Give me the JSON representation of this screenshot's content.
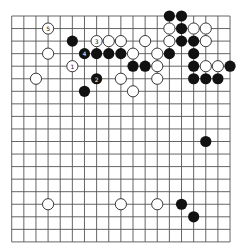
{
  "board": {
    "size": 19,
    "origin_x": 11.7,
    "origin_y": 16,
    "spacing_x": 12.13,
    "spacing_y": 12.55,
    "stone_radius": 5.6,
    "line_color": "#555555",
    "black_color": "#111111",
    "white_fill": "#ffffff",
    "white_stroke": "#222222"
  },
  "stones": {
    "black": [
      {
        "c": 13,
        "r": 0
      },
      {
        "c": 14,
        "r": 0
      },
      {
        "c": 14,
        "r": 1
      },
      {
        "c": 5,
        "r": 2
      },
      {
        "c": 14,
        "r": 2
      },
      {
        "c": 15,
        "r": 2
      },
      {
        "c": 6,
        "r": 3,
        "label": "4"
      },
      {
        "c": 7,
        "r": 3
      },
      {
        "c": 8,
        "r": 3
      },
      {
        "c": 9,
        "r": 3
      },
      {
        "c": 13,
        "r": 3
      },
      {
        "c": 15,
        "r": 3
      },
      {
        "c": 10,
        "r": 4
      },
      {
        "c": 11,
        "r": 4
      },
      {
        "c": 15,
        "r": 4
      },
      {
        "c": 18,
        "r": 4
      },
      {
        "c": 7,
        "r": 5,
        "label": "2"
      },
      {
        "c": 15,
        "r": 5
      },
      {
        "c": 16,
        "r": 5
      },
      {
        "c": 17,
        "r": 5
      },
      {
        "c": 6,
        "r": 6
      },
      {
        "c": 16,
        "r": 10
      },
      {
        "c": 14,
        "r": 15
      },
      {
        "c": 15,
        "r": 16
      }
    ],
    "white": [
      {
        "c": 3,
        "r": 1,
        "label": "5"
      },
      {
        "c": 13,
        "r": 1
      },
      {
        "c": 15,
        "r": 1
      },
      {
        "c": 16,
        "r": 1
      },
      {
        "c": 7,
        "r": 2,
        "label": "3"
      },
      {
        "c": 8,
        "r": 2
      },
      {
        "c": 9,
        "r": 2
      },
      {
        "c": 11,
        "r": 2
      },
      {
        "c": 13,
        "r": 2
      },
      {
        "c": 16,
        "r": 2
      },
      {
        "c": 3,
        "r": 3
      },
      {
        "c": 10,
        "r": 3
      },
      {
        "c": 12,
        "r": 3
      },
      {
        "c": 5,
        "r": 4,
        "label": "1"
      },
      {
        "c": 12,
        "r": 4
      },
      {
        "c": 16,
        "r": 4
      },
      {
        "c": 17,
        "r": 4
      },
      {
        "c": 2,
        "r": 5
      },
      {
        "c": 9,
        "r": 5
      },
      {
        "c": 12,
        "r": 5
      },
      {
        "c": 10,
        "r": 6
      },
      {
        "c": 3,
        "r": 15
      },
      {
        "c": 9,
        "r": 15
      },
      {
        "c": 12,
        "r": 15
      }
    ]
  },
  "move_labels": [
    "1",
    "2",
    "3",
    "4",
    "5"
  ]
}
